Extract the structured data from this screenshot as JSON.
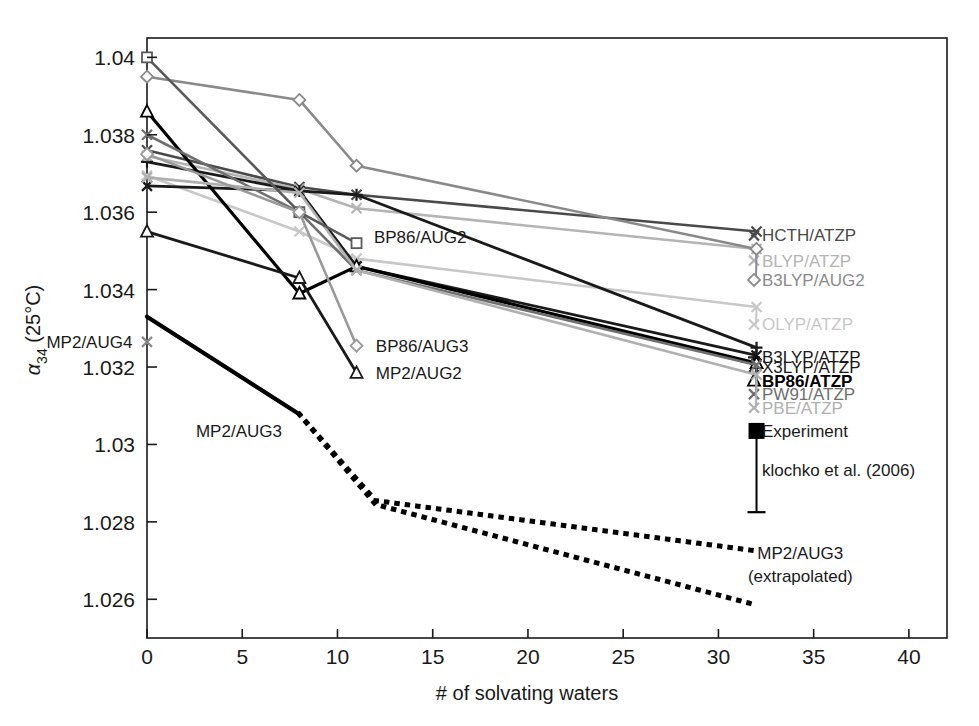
{
  "chart_data": {
    "type": "line",
    "title": "",
    "xlabel": "# of solvating waters",
    "ylabel_alpha": "α",
    "ylabel_sub": "34",
    "ylabel_rest": " (25°C)",
    "xlim": [
      0,
      42
    ],
    "ylim": [
      1.025,
      1.0405
    ],
    "xticks": [
      0,
      5,
      10,
      15,
      20,
      25,
      30,
      35,
      40
    ],
    "xticklabels": [
      "0",
      "5",
      "10",
      "15",
      "20",
      "25",
      "30",
      "35",
      "40"
    ],
    "yticks": [
      1.026,
      1.028,
      1.03,
      1.032,
      1.034,
      1.036,
      1.038,
      1.04
    ],
    "yticklabels": [
      "1.026",
      "1.028",
      "1.03",
      "1.032",
      "1.034",
      "1.036",
      "1.038",
      "1.04"
    ],
    "grid": false,
    "legend_position": "right-outside",
    "series": [
      {
        "name": "HCTH/ATZP",
        "color": "#4a4a4a",
        "marker": "x",
        "width": 2.6,
        "legend": true,
        "legend_y": 1.0354,
        "x": [
          0,
          8,
          11,
          32
        ],
        "values": [
          1.0376,
          1.03665,
          1.03645,
          1.0355
        ]
      },
      {
        "name": "BLYP/ATZP",
        "color": "#b4b4b4",
        "marker": "x",
        "width": 2.6,
        "legend": true,
        "legend_y": 1.03475,
        "x": [
          0,
          8,
          11,
          32
        ],
        "values": [
          1.03745,
          1.0366,
          1.0361,
          1.03505
        ]
      },
      {
        "name": "B3LYP/AUG2",
        "color": "#8a8a8a",
        "marker": "diamond",
        "width": 2.6,
        "legend": true,
        "legend_y": 1.03425,
        "x": [
          0,
          8,
          11,
          32
        ],
        "values": [
          1.0395,
          1.0389,
          1.0372,
          1.03505
        ]
      },
      {
        "name": "OLYP/ATZP",
        "color": "#c8c8c8",
        "marker": "x",
        "width": 2.6,
        "legend": true,
        "legend_y": 1.0331,
        "x": [
          0,
          8,
          11,
          32
        ],
        "values": [
          1.03695,
          1.0355,
          1.0348,
          1.03355
        ]
      },
      {
        "name": "B3LYP/ATZP",
        "color": "#1a1a1a",
        "marker": "plus",
        "width": 2.8,
        "legend": true,
        "legend_y": 1.03225,
        "x": [
          0,
          8,
          11,
          32
        ],
        "values": [
          1.0373,
          1.03655,
          1.03645,
          1.0325
        ]
      },
      {
        "name": "X3LYP/ATZP",
        "color": "#1a1a1a",
        "marker": "x",
        "width": 2.8,
        "legend": true,
        "legend_y": 1.032,
        "x": [
          0,
          8,
          11,
          32
        ],
        "values": [
          1.03668,
          1.03655,
          1.0346,
          1.0323
        ]
      },
      {
        "name": "BP86/ATZP",
        "color": "#000000",
        "marker": "triangle",
        "width": 3.2,
        "legend": true,
        "legend_y": 1.03165,
        "bold": true,
        "x": [
          0,
          8,
          11,
          32
        ],
        "values": [
          1.0386,
          1.0339,
          1.0346,
          1.0321
        ]
      },
      {
        "name": "PW91/ATZP",
        "color": "#6e6e6e",
        "marker": "x",
        "width": 2.6,
        "legend": true,
        "legend_y": 1.0313,
        "x": [
          0,
          8,
          11,
          32
        ],
        "values": [
          1.038,
          1.036,
          1.0345,
          1.03205
        ]
      },
      {
        "name": "PBE/ATZP",
        "color": "#b0b0b0",
        "marker": "x",
        "width": 2.6,
        "legend": true,
        "legend_y": 1.03095,
        "x": [
          0,
          8,
          11,
          32
        ],
        "values": [
          1.0369,
          1.0365,
          1.0345,
          1.0318
        ]
      },
      {
        "name": "BP86/AUG2",
        "color": "#5a5a5a",
        "marker": "square",
        "width": 2.6,
        "legend": false,
        "annot": true,
        "annot_x": 11.6,
        "annot_y": 1.03535,
        "label_anchor": "start",
        "x": [
          0,
          8,
          11
        ],
        "values": [
          1.04,
          1.036,
          1.0352
        ]
      },
      {
        "name": "BP86/AUG3",
        "color": "#9a9a9a",
        "marker": "diamond",
        "width": 2.6,
        "legend": false,
        "annot": true,
        "annot_x": 11.7,
        "annot_y": 1.03255,
        "label_anchor": "start",
        "x": [
          0,
          8,
          11
        ],
        "values": [
          1.0375,
          1.036,
          1.03255
        ]
      },
      {
        "name": "MP2/AUG2",
        "color": "#1a1a1a",
        "marker": "triangle",
        "width": 2.8,
        "legend": false,
        "annot": true,
        "annot_x": 11.7,
        "annot_y": 1.03185,
        "label_anchor": "start",
        "x": [
          0,
          8,
          11
        ],
        "values": [
          1.0355,
          1.0343,
          1.03185
        ]
      },
      {
        "name": "MP2/AUG4",
        "color": "#8a8a8a",
        "marker": "x",
        "width": 2.6,
        "legend": false,
        "annot": true,
        "annot_x": -0.45,
        "annot_y": 1.03265,
        "label_anchor": "end",
        "x": [
          0
        ],
        "values": [
          1.03265
        ]
      },
      {
        "name": "MP2/AUG3",
        "color": "#000000",
        "marker": "none",
        "width": 4.2,
        "legend": false,
        "annot": true,
        "annot_x": 7.4,
        "annot_y": 1.03035,
        "label_anchor": "end",
        "x": [
          0,
          8
        ],
        "values": [
          1.0333,
          1.03078
        ]
      }
    ],
    "dotted_series": [
      {
        "name": "MP2/AUG3 extrapolated upper",
        "color": "#000000",
        "x": [
          8,
          12,
          32
        ],
        "values": [
          1.03078,
          1.02855,
          1.02725
        ]
      },
      {
        "name": "MP2/AUG3 extrapolated lower",
        "color": "#000000",
        "x": [
          8,
          12,
          32
        ],
        "values": [
          1.03078,
          1.02845,
          1.02585
        ]
      }
    ],
    "dotted_annotation": {
      "line1": "MP2/AUG3",
      "line2": "(extrapolated)",
      "x": 34.3,
      "y": 1.02705
    },
    "experiment": {
      "label_line1": "Experiment",
      "label_line2": "klochko et al. (2006)",
      "color": "#000000",
      "marker": "filled-square",
      "x": 32,
      "value": 1.03035,
      "err_low": 1.02825,
      "err_high": 1.03035,
      "legend_y_line1": 1.03035,
      "legend_y_line2": 1.02935
    }
  }
}
